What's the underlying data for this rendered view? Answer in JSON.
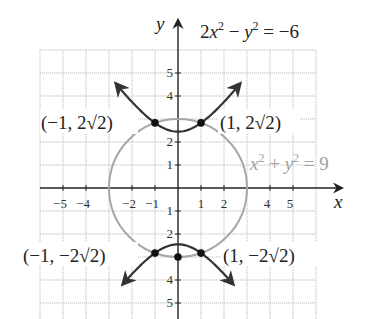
{
  "chart_data": {
    "type": "line",
    "title": "",
    "xlabel": "x",
    "ylabel": "y",
    "xlim": [
      -6,
      6
    ],
    "ylim": [
      -6,
      6
    ],
    "grid": true,
    "x_tick_labels": [
      "−5",
      "−4",
      "−2",
      "−1",
      "1",
      "2",
      "4",
      "5"
    ],
    "x_ticks": [
      -5,
      -4,
      -2,
      -1,
      1,
      2,
      4,
      5
    ],
    "y_tick_labels": [
      "5",
      "4",
      "2",
      "1",
      "−1",
      "−2",
      "−4",
      "−5"
    ],
    "y_ticks": [
      5,
      4,
      2,
      1,
      -1,
      -2,
      -4,
      -5
    ],
    "series": [
      {
        "name": "hyperbola",
        "equation": "2x² − y² = −6",
        "color": "#333333",
        "kind": "hyperbola",
        "description": "Two branches opening up and down, vertices at (0, ±√6)"
      },
      {
        "name": "circle",
        "equation": "x² + y² = 9",
        "color": "#a6a6a6",
        "kind": "circle",
        "center": [
          0,
          0
        ],
        "radius": 3
      }
    ],
    "intersection_points": [
      {
        "x": -1,
        "y": 2.828,
        "label": "(−1, 2√2)"
      },
      {
        "x": 1,
        "y": 2.828,
        "label": "(1, 2√2)"
      },
      {
        "x": -1,
        "y": -2.828,
        "label": "(−1, −2√2)"
      },
      {
        "x": 1,
        "y": -2.828,
        "label": "(1, −2√2)"
      }
    ],
    "extra_points": [
      {
        "x": 0,
        "y": -3
      }
    ]
  },
  "labels": {
    "axis_x": "x",
    "axis_y": "y",
    "hyperbola_eq_main": "2x",
    "hyperbola_eq_exp1": "2",
    "hyperbola_eq_mid": " − y",
    "hyperbola_eq_exp2": "2",
    "hyperbola_eq_end": " = −6",
    "circle_eq_x": "x",
    "circle_eq_exp1": "2",
    "circle_eq_plus": " + y",
    "circle_eq_exp2": "2",
    "circle_eq_end": " = 9",
    "pt_ul": "(−1, 2√2)",
    "pt_ur": "(1, 2√2)",
    "pt_ll": "(−1, −2√2)",
    "pt_lr": "(1, −2√2)",
    "xt_m5": "−5",
    "xt_m4": "−4",
    "xt_m2": "−2",
    "xt_m1": "−1",
    "xt_1": "1",
    "xt_2": "2",
    "xt_4": "4",
    "xt_5": "5",
    "yt_5": "5",
    "yt_4": "4",
    "yt_2": "2",
    "yt_1": "1",
    "yt_m1": "1",
    "yt_m2": "2",
    "yt_m4": "4",
    "yt_m5": "5"
  },
  "colors": {
    "hyperbola": "#333333",
    "circle": "#a6a6a6",
    "grid": "#bdbdbd",
    "axis": "#222222",
    "circle_label": "#a0a0a0"
  }
}
